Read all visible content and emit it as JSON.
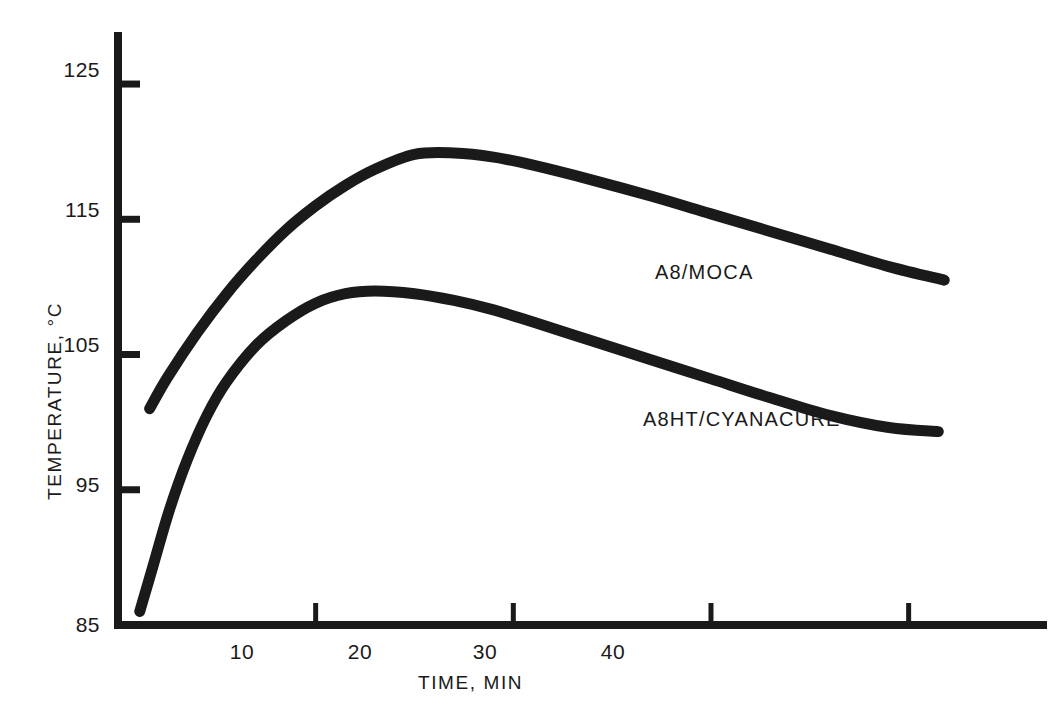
{
  "chart_data": {
    "type": "line",
    "title": "",
    "xlabel": "TIME, MIN",
    "ylabel": "TEMPERATURE, °C",
    "xlim": [
      0,
      47
    ],
    "ylim": [
      85,
      127
    ],
    "grid": false,
    "legend_position": "inline-right-of-curve-end",
    "xticks": [
      10,
      20,
      30,
      40
    ],
    "xtick_labels": [
      "10",
      "20",
      "30",
      "40"
    ],
    "yticks": [
      85,
      95,
      105,
      115,
      125
    ],
    "ytick_labels": [
      "85",
      "95",
      "105",
      "115",
      "125"
    ],
    "series": [
      {
        "name": "A8/MOCA",
        "label": "A8/MOCA",
        "color": "#1a1a1a",
        "x": [
          1.6,
          2.5,
          4.0,
          5.5,
          7.0,
          8.5,
          10.0,
          11.5,
          13.0,
          15.0,
          17.0,
          19.0,
          21.0,
          24.0,
          27.0,
          30.0,
          33.0,
          36.0,
          39.0,
          41.8
        ],
        "y": [
          101.0,
          103.3,
          106.6,
          109.5,
          112.0,
          114.2,
          116.0,
          117.5,
          118.7,
          119.8,
          119.9,
          119.6,
          119.0,
          117.9,
          116.7,
          115.4,
          114.1,
          112.8,
          111.5,
          110.5
        ]
      },
      {
        "name": "A8HT/CYANACURE",
        "label": "A8HT/CYANACURE",
        "color": "#1a1a1a",
        "x": [
          1.1,
          1.8,
          2.6,
          3.5,
          4.5,
          5.5,
          7.0,
          8.5,
          10.0,
          11.5,
          13.0,
          15.0,
          17.0,
          19.0,
          21.0,
          24.0,
          27.0,
          30.0,
          33.0,
          36.0,
          39.0,
          41.5
        ],
        "y": [
          86.0,
          89.5,
          93.5,
          97.2,
          100.5,
          103.0,
          105.7,
          107.5,
          108.8,
          109.5,
          109.7,
          109.5,
          109.0,
          108.3,
          107.4,
          106.0,
          104.6,
          103.2,
          101.8,
          100.5,
          99.6,
          99.3
        ]
      }
    ],
    "annotations": [
      {
        "text": "A8/MOCA",
        "attached_to": "A8/MOCA",
        "at_x": 42.5,
        "at_y": 110.2
      },
      {
        "text": "A8HT/CYANACURE",
        "attached_to": "A8HT/CYANACURE",
        "at_x": 42.3,
        "at_y": 99.0
      }
    ]
  },
  "axis": {
    "x_title": "TIME, MIN",
    "y_title": "TEMPERATURE, °C"
  },
  "colors": {
    "ink": "#1a1a1a",
    "background": "#ffffff"
  }
}
